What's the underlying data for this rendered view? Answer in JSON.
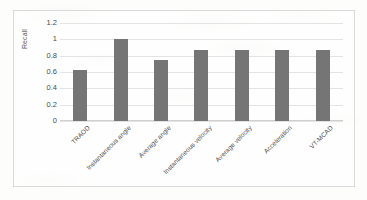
{
  "figure": {
    "background_color": "#fdfdfc",
    "border_color": "#d9d9d9",
    "bar_color": "#757575",
    "gridline_color": "#e3e3e3"
  },
  "chart_data": {
    "type": "bar",
    "title": "",
    "subtitle": "",
    "xlabel": "",
    "ylabel": "Recall",
    "categories": [
      "TRAOD",
      "Instantaneous angle",
      "Average angle",
      "Instantaneous velocity",
      "Average velocity",
      "Acceleration",
      "VT-MCAD"
    ],
    "values": [
      0.62,
      1.0,
      0.75,
      0.875,
      0.875,
      0.875,
      0.875
    ],
    "ylim": [
      0,
      1.2
    ],
    "ytick_labels": [
      "0",
      "0.2",
      "0.4",
      "0.6",
      "0.8",
      "1",
      "1.2"
    ],
    "ytick_values": [
      0,
      0.2,
      0.4,
      0.6,
      0.8,
      1,
      1.2
    ],
    "grid": true,
    "grid_axis": "y",
    "legend": false,
    "legend_position": "none",
    "series": [
      {
        "name": "Recall",
        "color": "#757575",
        "values": [
          0.62,
          1.0,
          0.75,
          0.875,
          0.875,
          0.875,
          0.875
        ]
      }
    ],
    "xtick_label_rotation": -45
  }
}
